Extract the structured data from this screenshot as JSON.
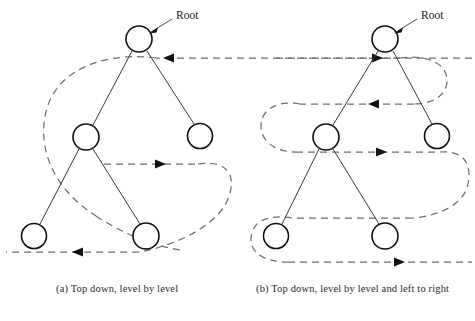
{
  "figure": {
    "background_color": "#ffffff",
    "line_color": "#6e6e6e",
    "node_stroke_color": "#111111",
    "arrow_color": "#111111",
    "panels": [
      {
        "id": "a",
        "caption": "(a) Top down, level by level",
        "root_label": "Root",
        "nodes": [
          {
            "name": "root",
            "cx": 139,
            "cy": 39,
            "r": 13
          },
          {
            "name": "level2-left",
            "cx": 86,
            "cy": 137,
            "r": 13
          },
          {
            "name": "level2-right",
            "cx": 200,
            "cy": 136,
            "r": 12.5
          },
          {
            "name": "leaf-left",
            "cx": 34,
            "cy": 236,
            "r": 12.5
          },
          {
            "name": "leaf-right",
            "cx": 146,
            "cy": 236,
            "r": 13
          }
        ],
        "edges": [
          {
            "from": "root",
            "to": "level2-left"
          },
          {
            "from": "root",
            "to": "level2-right"
          },
          {
            "from": "level2-left",
            "to": "leaf-left"
          },
          {
            "from": "level2-left",
            "to": "leaf-right"
          }
        ],
        "arrow_directions": [
          "left",
          "right",
          "left"
        ]
      },
      {
        "id": "b",
        "caption": "(b) Top down, level by level and left to right",
        "root_label": "Root",
        "nodes": [
          {
            "name": "root",
            "cx": 385,
            "cy": 39,
            "r": 13
          },
          {
            "name": "level2-left",
            "cx": 326,
            "cy": 137,
            "r": 13
          },
          {
            "name": "level2-right",
            "cx": 437,
            "cy": 136,
            "r": 12.5
          },
          {
            "name": "leaf-left",
            "cx": 276,
            "cy": 236,
            "r": 12.5
          },
          {
            "name": "leaf-right",
            "cx": 385,
            "cy": 236,
            "r": 13
          }
        ],
        "edges": [
          {
            "from": "root",
            "to": "level2-left"
          },
          {
            "from": "root",
            "to": "level2-right"
          },
          {
            "from": "level2-left",
            "to": "leaf-left"
          },
          {
            "from": "level2-left",
            "to": "leaf-right"
          }
        ],
        "arrow_directions": [
          "right",
          "left",
          "right",
          "right"
        ]
      }
    ]
  }
}
